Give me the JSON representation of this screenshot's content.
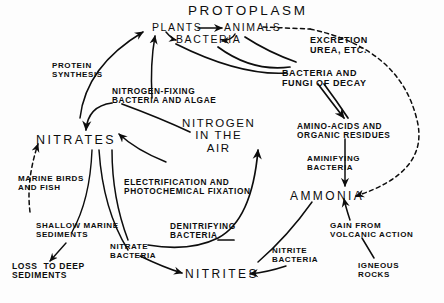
{
  "diagram": {
    "ink_color": "#0d0d0d",
    "background_color": "#fdfdfd",
    "nodes": {
      "protoplasm": "PROTOPLASM",
      "plants": "PLANTS",
      "animals": "ANIMALS",
      "bacteria": "BACTERIA",
      "nitrogen_in_air": "NITROGEN\nIN THE\nAIR",
      "nitrates": "NITRATES",
      "nitrites": "NITRITES",
      "ammonia": "AMMONIA",
      "amino_acids": "AMINO-ACIDS AND\nORGANIC RESIDUES",
      "loss_to_deep_sediments": "LOSS  TO DEEP\nSEDIMENTS",
      "igneous_rocks": "IGNEOUS\nROCKS"
    },
    "process_labels": {
      "excretion": "EXCRETION\nUREA, ETC.",
      "protein_synthesis": "PROTEIN\nSYNTHESIS",
      "nitrogen_fixing": "NITROGEN-FIXING\nBACTERIA AND ALGAE",
      "decay": "BACTERIA AND\nFUNGI OF DECAY",
      "aminifying": "AMINIFYING\nBACTERIA",
      "marine_birds": "MARINE BIRDS\nAND FISH",
      "electrification": "ELECTRIFICATION AND\nPHOTOCHEMICAL FIXATION",
      "shallow_marine": "SHALLOW MARINE\nSEDIMENTS",
      "nitrate_bacteria": "NITRATE\nBACTERIA",
      "denitrifying": "DENITRIFYING\nBACTERIA",
      "nitrite_bacteria": "NITRITE\nBACTERIA",
      "gain_volcanic": "GAIN FROM\nVOLCANIC ACTION"
    }
  }
}
